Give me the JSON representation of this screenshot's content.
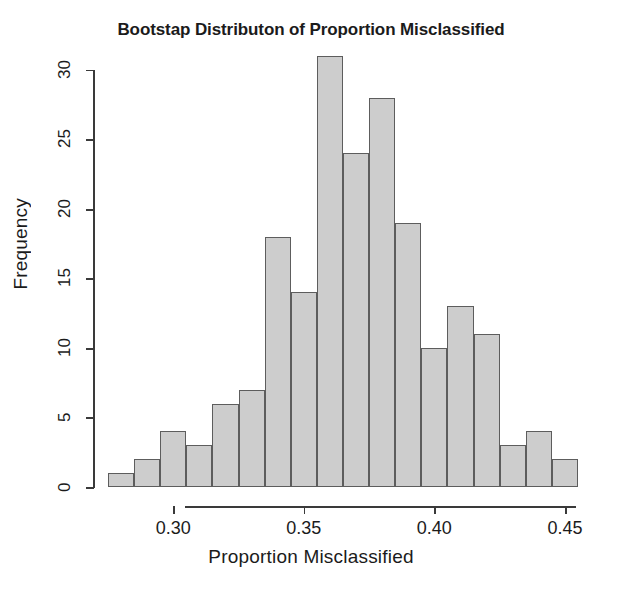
{
  "chart_data": {
    "type": "bar",
    "title": "Bootstap Distributon of Proportion Misclassified",
    "subtitle": "",
    "xlabel": "Proportion Misclassified",
    "ylabel": "Frequency",
    "categories": [
      "0.275-0.285",
      "0.285-0.295",
      "0.295-0.305",
      "0.305-0.315",
      "0.315-0.325",
      "0.325-0.335",
      "0.335-0.345",
      "0.345-0.355",
      "0.355-0.365",
      "0.365-0.375",
      "0.375-0.385",
      "0.385-0.395",
      "0.395-0.405",
      "0.405-0.415",
      "0.415-0.425",
      "0.425-0.435",
      "0.435-0.445",
      "0.445-0.455"
    ],
    "bin_edges": [
      0.275,
      0.285,
      0.295,
      0.305,
      0.315,
      0.325,
      0.335,
      0.345,
      0.355,
      0.365,
      0.375,
      0.385,
      0.395,
      0.405,
      0.415,
      0.425,
      0.435,
      0.445,
      0.455
    ],
    "values": [
      1,
      2,
      4,
      3,
      6,
      7,
      18,
      14,
      31,
      24,
      28,
      19,
      10,
      13,
      11,
      3,
      4,
      2
    ],
    "bin_width": 0.01,
    "xlim": [
      0.275,
      0.455
    ],
    "ylim": [
      0,
      31
    ],
    "x_ticks": [
      0.3,
      0.35,
      0.4,
      0.45
    ],
    "x_tick_labels": [
      "0.30",
      "0.35",
      "0.40",
      "0.45"
    ],
    "y_ticks": [
      0,
      5,
      10,
      15,
      20,
      25,
      30
    ],
    "y_tick_labels": [
      "0",
      "5",
      "10",
      "15",
      "20",
      "25",
      "30"
    ],
    "grid": false,
    "legend": false,
    "legend_position": "none",
    "bar_fill_color": "#cdcdcd",
    "bar_border_color": "#5d5d5d",
    "axis_color": "#3a3a3a",
    "background_color": "#ffffff",
    "total_count": 200
  }
}
